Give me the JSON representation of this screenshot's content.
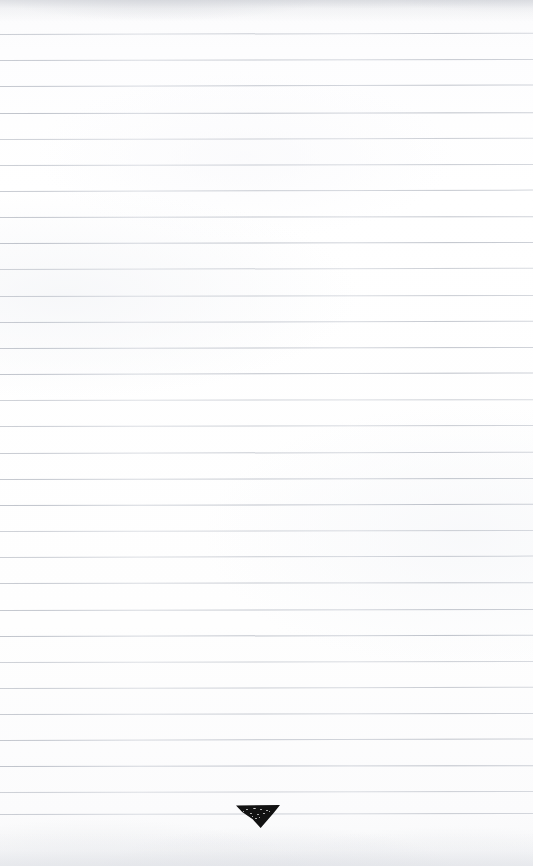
{
  "document": {
    "type": "scanned-ruled-notebook-page",
    "page_width": 533,
    "page_height": 866,
    "background_color": "#fdfdfe",
    "text_content": "",
    "is_blank": "true"
  },
  "ruling": {
    "line_color": "#a0a6b2",
    "line_count": 30,
    "first_line_y": 34,
    "line_spacing": 26.2,
    "line_thickness": 1,
    "left_edge_x": 0,
    "right_edge_x": 533,
    "skew_degrees": -0.12,
    "lines": [
      {
        "index": 1,
        "y": 34,
        "skew": -0.14
      },
      {
        "index": 2,
        "y": 60,
        "skew": -0.1
      },
      {
        "index": 3,
        "y": 86,
        "skew": -0.16
      },
      {
        "index": 4,
        "y": 113,
        "skew": -0.08
      },
      {
        "index": 5,
        "y": 139,
        "skew": -0.13
      },
      {
        "index": 6,
        "y": 165,
        "skew": -0.11
      },
      {
        "index": 7,
        "y": 191,
        "skew": -0.15
      },
      {
        "index": 8,
        "y": 217,
        "skew": -0.09
      },
      {
        "index": 9,
        "y": 243,
        "skew": -0.12
      },
      {
        "index": 10,
        "y": 269,
        "skew": -0.14
      },
      {
        "index": 11,
        "y": 296,
        "skew": -0.1
      },
      {
        "index": 12,
        "y": 322,
        "skew": -0.13
      },
      {
        "index": 13,
        "y": 348,
        "skew": -0.11
      },
      {
        "index": 14,
        "y": 374,
        "skew": -0.16
      },
      {
        "index": 15,
        "y": 400,
        "skew": -0.09
      },
      {
        "index": 16,
        "y": 426,
        "skew": -0.12
      },
      {
        "index": 17,
        "y": 453,
        "skew": -0.14
      },
      {
        "index": 18,
        "y": 479,
        "skew": -0.1
      },
      {
        "index": 19,
        "y": 505,
        "skew": -0.13
      },
      {
        "index": 20,
        "y": 531,
        "skew": -0.11
      },
      {
        "index": 21,
        "y": 557,
        "skew": -0.15
      },
      {
        "index": 22,
        "y": 583,
        "skew": -0.09
      },
      {
        "index": 23,
        "y": 610,
        "skew": -0.12
      },
      {
        "index": 24,
        "y": 636,
        "skew": -0.14
      },
      {
        "index": 25,
        "y": 662,
        "skew": -0.1
      },
      {
        "index": 26,
        "y": 688,
        "skew": -0.13
      },
      {
        "index": 27,
        "y": 714,
        "skew": -0.11
      },
      {
        "index": 28,
        "y": 740,
        "skew": -0.16
      },
      {
        "index": 29,
        "y": 766,
        "skew": -0.09
      },
      {
        "index": 30,
        "y": 792,
        "skew": -0.12
      },
      {
        "index": 31,
        "y": 814,
        "skew": -0.1
      }
    ]
  },
  "marks": {
    "ink_triangle": {
      "label": "downward ink triangle",
      "color": "#121212",
      "x": 236,
      "y": 805,
      "width": 44,
      "height": 23,
      "orientation": "pointing-down"
    }
  },
  "scan_artifacts": {
    "top_smudge": {
      "color": "#c4c7ce",
      "height": 22
    },
    "bottom_smudge": {
      "color": "#e2e4e9",
      "height": 34
    }
  }
}
